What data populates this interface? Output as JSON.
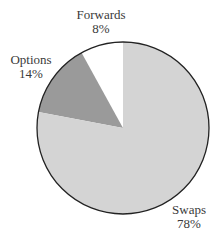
{
  "chart_data": {
    "type": "pie",
    "title": "",
    "categories": [
      "Swaps",
      "Options",
      "Forwards"
    ],
    "values": [
      78,
      14,
      8
    ],
    "unit": "%",
    "labels": [
      {
        "name": "Swaps",
        "value_label": "78%"
      },
      {
        "name": "Options",
        "value_label": "14%"
      },
      {
        "name": "Forwards",
        "value_label": "8%"
      }
    ],
    "colors": {
      "Swaps": "#d4d4d4",
      "Options": "#9a9a9a",
      "Forwards": "#ffffff"
    },
    "start_angle": "12 o'clock",
    "direction": "counter-clockwise for Forwards then Options; Swaps fills remainder",
    "legend": "none (direct labels)",
    "outline_color": "#222222"
  },
  "labels": {
    "forwards_name": "Forwards",
    "forwards_value": "8%",
    "options_name": "Options",
    "options_value": "14%",
    "swaps_name": "Swaps",
    "swaps_value": "78%"
  }
}
